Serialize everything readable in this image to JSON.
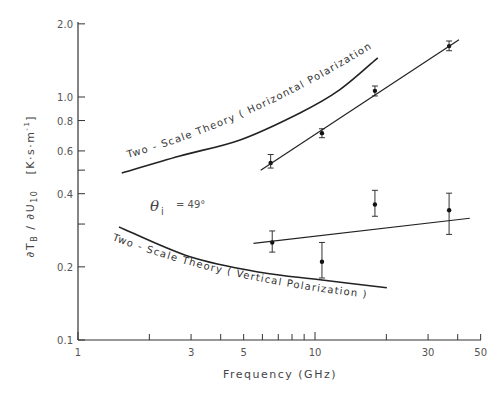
{
  "chart_data": {
    "type": "line",
    "title": "",
    "xlabel": "Frequency (GHz)",
    "ylabel": "∂T_B / ∂U_10 [K·s·m⁻¹]",
    "xscale": "log",
    "yscale": "log",
    "xlim": [
      1,
      50
    ],
    "ylim": [
      0.1,
      2.0
    ],
    "grid": false,
    "legend": "none (curves labeled inline)",
    "x_ticks": [
      1,
      2,
      3,
      4,
      5,
      6,
      7,
      8,
      9,
      10,
      20,
      30,
      40,
      50
    ],
    "x_tick_labels": [
      "1",
      "3",
      "5",
      "10",
      "30",
      "50"
    ],
    "y_ticks": [
      0.1,
      0.2,
      0.3,
      0.4,
      0.5,
      0.6,
      0.8,
      1.0,
      2.0
    ],
    "y_tick_labels": [
      "0.1",
      "0.2",
      "0.4",
      "0.6",
      "0.8",
      "1.0",
      "2.0"
    ],
    "annotations": [
      {
        "text": "θi = 49°",
        "x": 2.2,
        "y": 0.38
      }
    ],
    "series": [
      {
        "name": "Two-Scale Theory (Horizontal Polarization)",
        "kind": "theory-curve",
        "x": [
          1.53,
          2.69,
          4.83,
          8.64,
          12.7,
          18.4
        ],
        "y": [
          0.487,
          0.572,
          0.666,
          0.86,
          1.07,
          1.45
        ]
      },
      {
        "name": "Two-Scale Theory (Vertical Polarization)",
        "kind": "theory-curve",
        "x": [
          1.49,
          2.97,
          5.85,
          10.5,
          20.1
        ],
        "y": [
          0.292,
          0.22,
          0.19,
          0.177,
          0.164
        ]
      },
      {
        "name": "Horizontal polarization measurements",
        "kind": "points-with-error",
        "x": [
          6.5,
          10.7,
          17.9,
          36.8
        ],
        "y": [
          0.535,
          0.71,
          1.06,
          1.62
        ],
        "y_low": [
          0.51,
          0.68,
          1.01,
          1.55
        ],
        "y_high": [
          0.58,
          0.74,
          1.11,
          1.7
        ]
      },
      {
        "name": "Horizontal polarization fit",
        "kind": "fit-line",
        "x": [
          5.9,
          40.5
        ],
        "y": [
          0.5,
          1.72
        ]
      },
      {
        "name": "Vertical polarization measurements",
        "kind": "points-with-error",
        "x": [
          6.6,
          10.7,
          17.9,
          36.8
        ],
        "y": [
          0.252,
          0.21,
          0.361,
          0.342
        ],
        "y_low": [
          0.23,
          0.18,
          0.323,
          0.272
        ],
        "y_high": [
          0.281,
          0.252,
          0.413,
          0.402
        ]
      },
      {
        "name": "Vertical polarization fit",
        "kind": "fit-line",
        "x": [
          5.5,
          45
        ],
        "y": [
          0.25,
          0.317
        ]
      }
    ]
  },
  "labels": {
    "xlabel": "Frequency (GHz)",
    "ylabel_main": "∂T",
    "ylabel_sub_b": "B",
    "ylabel_mid": " / ∂U",
    "ylabel_sub_10": "10",
    "ylabel_units": "[K·s·m",
    "ylabel_units_exp": "-1",
    "ylabel_units_close": "]",
    "curve_h": "Two - Scale Theory  ( Horizontal Polarization )",
    "curve_v": "Two - Scale Theory  ( Vertical Polarization )",
    "theta_symbol": "θ",
    "theta_sub": "i",
    "theta_value": "= 49°"
  }
}
